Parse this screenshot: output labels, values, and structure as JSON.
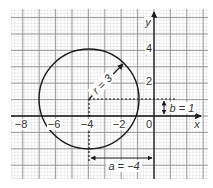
{
  "diagram": {
    "axes": {
      "x_label": "x",
      "y_label": "y",
      "x_ticks": [
        {
          "value": -8,
          "label": "−8"
        },
        {
          "value": -6,
          "label": "−6"
        },
        {
          "value": -4,
          "label": "−4"
        },
        {
          "value": -2,
          "label": "−2"
        },
        {
          "value": 0,
          "label": "0"
        }
      ],
      "y_ticks": [
        {
          "value": 2,
          "label": "2"
        },
        {
          "value": 4,
          "label": "4"
        }
      ]
    },
    "circle": {
      "center": [
        -4,
        1
      ],
      "radius": 3
    },
    "annotations": {
      "radius_label": "r = 3",
      "a_label": "a = −4",
      "b_label": "b = 1"
    },
    "colors": {
      "grid_minor": "#c8c8c8",
      "grid_major": "#8a8a8a",
      "ink": "#1a1a1a"
    }
  }
}
